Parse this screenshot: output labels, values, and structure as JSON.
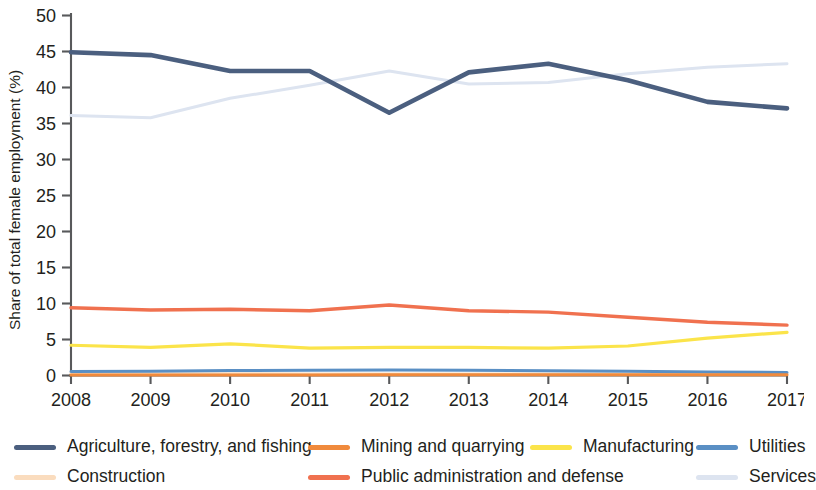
{
  "chart_data": {
    "type": "line",
    "title": "",
    "xlabel": "",
    "ylabel": "Share of total female employment (%)",
    "x": [
      2008,
      2009,
      2010,
      2011,
      2012,
      2013,
      2014,
      2015,
      2016,
      2017
    ],
    "xtick_labels": [
      "2008",
      "2009",
      "2010",
      "2011",
      "2012",
      "2013",
      "2014",
      "2015",
      "2016",
      "2017"
    ],
    "ytick_labels": [
      "0",
      "5",
      "10",
      "15",
      "20",
      "25",
      "30",
      "35",
      "40",
      "45",
      "50"
    ],
    "yticks": [
      0,
      5,
      10,
      15,
      20,
      25,
      30,
      35,
      40,
      45,
      50
    ],
    "ylim": [
      0,
      50
    ],
    "xlim": [
      2008,
      2017
    ],
    "grid": false,
    "legend_position": "bottom",
    "series": [
      {
        "name": "Agriculture, forestry, and fishing",
        "color": "#4b5f7f",
        "width": 4.6,
        "values": [
          44.9,
          44.5,
          42.3,
          42.3,
          36.5,
          42.1,
          43.3,
          41.0,
          38.0,
          37.1
        ]
      },
      {
        "name": "Mining and quarrying",
        "color": "#f08a3c",
        "width": 3.0,
        "values": [
          0.08,
          0.08,
          0.08,
          0.08,
          0.09,
          0.09,
          0.09,
          0.09,
          0.1,
          0.1
        ]
      },
      {
        "name": "Manufacturing",
        "color": "#fbe44a",
        "width": 3.2,
        "values": [
          4.2,
          3.9,
          4.4,
          3.8,
          3.9,
          3.9,
          3.8,
          4.1,
          5.2,
          6.0
        ]
      },
      {
        "name": "Utilities",
        "color": "#5a8fc4",
        "width": 3.0,
        "values": [
          0.55,
          0.6,
          0.68,
          0.72,
          0.78,
          0.72,
          0.66,
          0.58,
          0.5,
          0.42
        ]
      },
      {
        "name": "Construction",
        "color": "#fadcbe",
        "width": 3.0,
        "values": [
          0.3,
          0.26,
          0.24,
          0.22,
          0.22,
          0.22,
          0.22,
          0.22,
          0.24,
          0.26
        ]
      },
      {
        "name": "Public administration and defense",
        "color": "#f0714f",
        "width": 3.4,
        "values": [
          9.4,
          9.1,
          9.2,
          9.0,
          9.8,
          9.0,
          8.8,
          8.1,
          7.4,
          7.0
        ]
      },
      {
        "name": "Services",
        "color": "#dde4f0",
        "width": 3.0,
        "values": [
          36.1,
          35.8,
          38.5,
          40.3,
          42.3,
          40.5,
          40.7,
          41.9,
          42.8,
          43.3
        ]
      }
    ]
  },
  "legend": {
    "row1": [
      {
        "label": "Agriculture, forestry, and fishing",
        "color": "#4b5f7f",
        "left": 14
      },
      {
        "label": "Mining and quarrying",
        "color": "#f08a3c",
        "left": 308
      },
      {
        "label": "Manufacturing",
        "color": "#fbe44a",
        "left": 530
      },
      {
        "label": "Utilities",
        "color": "#5a8fc4",
        "left": 696
      }
    ],
    "row2": [
      {
        "label": "Construction",
        "color": "#fadcbe",
        "left": 14
      },
      {
        "label": "Public administration and defense",
        "color": "#f0714f",
        "left": 308
      },
      {
        "label": "Services",
        "color": "#dde4f0",
        "left": 696
      }
    ]
  }
}
